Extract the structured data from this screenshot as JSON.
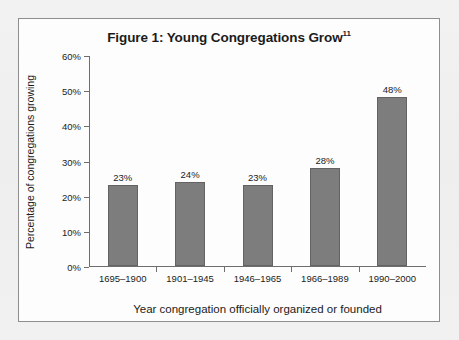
{
  "figure": {
    "title_main": "Figure 1: Young Congregations Grow",
    "title_superscript": "11"
  },
  "chart_data": {
    "type": "bar",
    "title": "Figure 1: Young Congregations Grow",
    "categories": [
      "1695–1900",
      "1901–1945",
      "1946–1965",
      "1966–1989",
      "1990–2000"
    ],
    "values": [
      23,
      24,
      23,
      28,
      48
    ],
    "value_labels": [
      "23%",
      "24%",
      "23%",
      "28%",
      "48%"
    ],
    "xlabel": "Year congregation officially organized or founded",
    "ylabel": "Percentage of congregations growing",
    "ylim": [
      0,
      60
    ],
    "ytick_step": 10,
    "ytick_labels": [
      "0%",
      "10%",
      "20%",
      "30%",
      "40%",
      "50%",
      "60%"
    ],
    "ytick_values": [
      0,
      10,
      20,
      30,
      40,
      50,
      60
    ],
    "grid": false,
    "legend": "none",
    "series": [
      {
        "name": "Percentage of congregations growing",
        "values": [
          23,
          24,
          23,
          28,
          48
        ]
      }
    ],
    "colors": {
      "bar_fill": "#7d7d7d",
      "bar_stroke": "#636363",
      "axis": "#6e6e6e",
      "text": "#1b1b1b",
      "plot_background": "#fdfdfd",
      "frame_border": "#8e8e8e",
      "page_background": "#f0f0f0"
    }
  }
}
